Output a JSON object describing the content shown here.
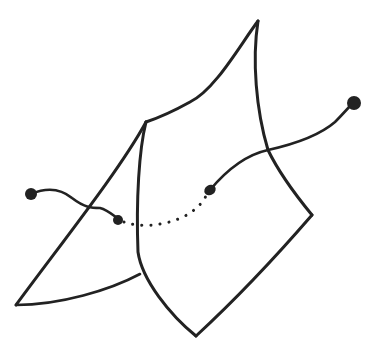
{
  "diagram": {
    "colors": {
      "ink": "#222222",
      "background": "#ffffff"
    },
    "surface": {
      "back_sheet_top_edge": "M258,21 C240,45 215,90 190,102 C172,112 158,118 146,122",
      "back_sheet_right_edge": "M258,21 C252,60 256,110 268,150 C280,175 298,198 312,215",
      "front_fold_edge": "M146,122 C139,150 136,200 138,252 C142,280 170,315 196,336",
      "bottom_right_edge": "M196,336 C235,300 280,252 312,215",
      "left_flap_diagonal": "M146,122 C120,170 60,245 16,305",
      "left_flap_bottom": "M16,305 C60,305 110,290 140,274"
    },
    "curve": {
      "left_end_dot": {
        "cx": 31,
        "cy": 194,
        "r": 6
      },
      "left_segment": "M31,194 C45,188 60,188 72,198 C85,208 92,208 100,208 C108,210 114,216 120,220",
      "entry_dot": {
        "cx": 118,
        "cy": 220,
        "r": 5
      },
      "hidden_dotted_segment": "M124,222 C140,228 165,226 185,216 C195,210 202,205 208,192",
      "exit_dot": {
        "cx": 210,
        "cy": 190,
        "rx": 6,
        "ry": 5
      },
      "right_segment": "M210,190 C225,172 245,155 268,150 C295,144 320,135 335,122 C343,114 348,108 352,104",
      "right_end_dot": {
        "cx": 354,
        "cy": 103,
        "r": 7
      }
    }
  }
}
